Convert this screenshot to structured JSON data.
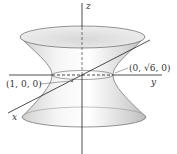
{
  "figure": {
    "axes": {
      "x_label": "x",
      "y_label": "y",
      "z_label": "z"
    },
    "points": [
      {
        "label": "(1, 0, 0)",
        "coords": [
          1,
          0,
          0
        ]
      },
      {
        "label_prefix": "(0, ",
        "label_radical": "√6",
        "label_suffix": ", 0)",
        "coords": [
          0,
          2.449,
          0
        ]
      }
    ],
    "colors": {
      "surface_light": "#f4f4f4",
      "surface_shade": "#c8c8c8",
      "outline": "#555555",
      "axis": "#222222"
    }
  }
}
